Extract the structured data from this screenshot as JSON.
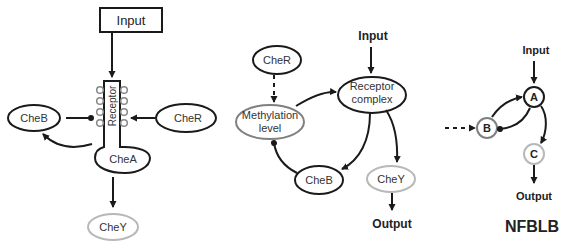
{
  "panel1": {
    "input": "Input",
    "receptor": "Receptor",
    "cheA": "CheA",
    "cheB": "CheB",
    "cheR": "CheR",
    "cheY": "CheY"
  },
  "panel2": {
    "input": "Input",
    "cheR": "CheR",
    "receptor_line1": "Receptor",
    "receptor_line2": "complex",
    "methylation_line1": "Methylation",
    "methylation_line2": "level",
    "cheB": "CheB",
    "cheY": "CheY",
    "output": "Output"
  },
  "panel3": {
    "input": "Input",
    "nodeA": "A",
    "nodeB": "B",
    "nodeC": "C",
    "output": "Output",
    "title": "NFBLB"
  },
  "colors": {
    "stroke": "#1a1a1a",
    "gray": "#808080",
    "lightgray": "#b8b8b8"
  }
}
